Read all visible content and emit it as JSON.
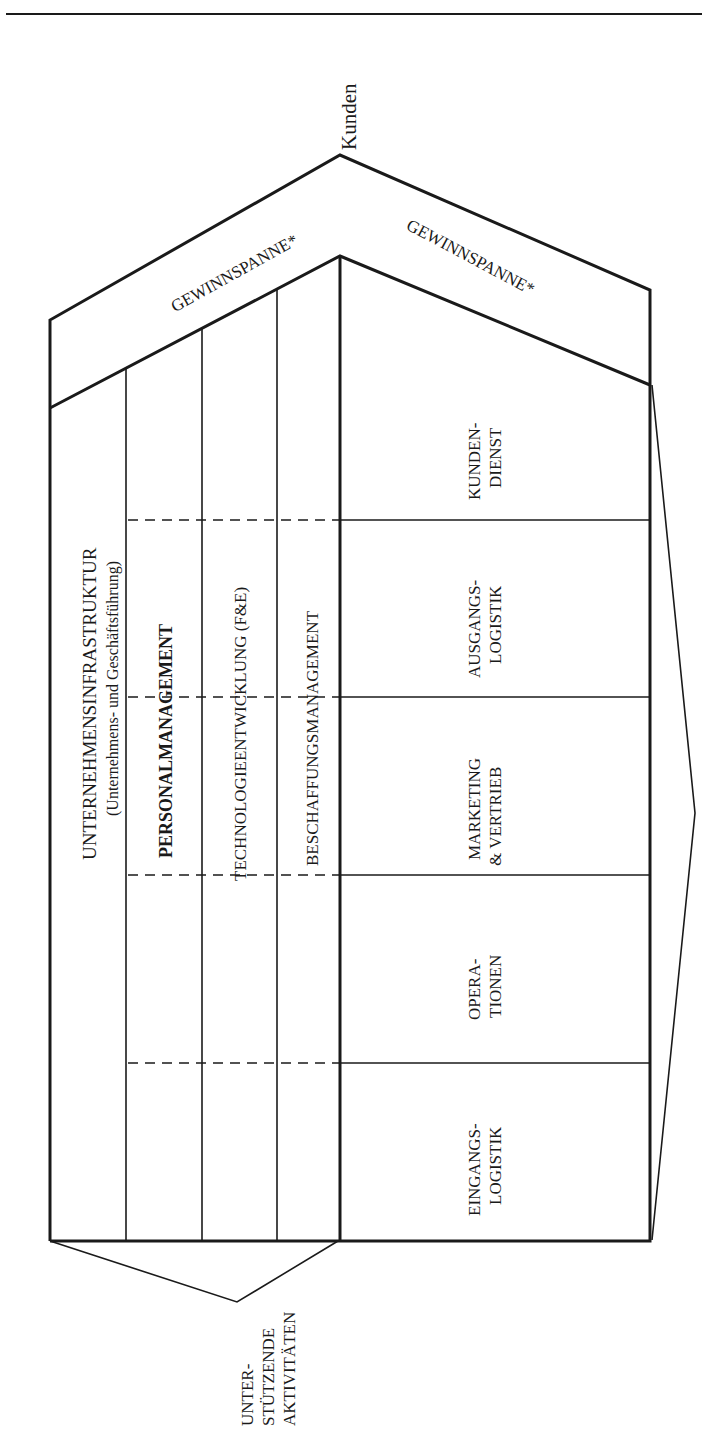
{
  "diagram": {
    "customers_label": "Kunden",
    "margin_left": "GEWINNSPANNE*",
    "margin_right": "GEWINNSPANNE*",
    "support_activities": [
      {
        "label": "UNTERNEHMENSINFRASTRUKTUR",
        "sublabel": "(Unternehmens- und Geschäftsführung)"
      },
      {
        "label": "PERSONALMANAGEMENT"
      },
      {
        "label": "TECHNOLOGIEENTWICKLUNG (F&E)"
      },
      {
        "label": "BESCHAFFUNGSMANAGEMENT"
      }
    ],
    "primary_activities": [
      {
        "line1": "EINGANGS-",
        "line2": "LOGISTIK"
      },
      {
        "line1": "OPERA-",
        "line2": "TIONEN"
      },
      {
        "line1": "MARKETING",
        "line2": "& VERTRIEB"
      },
      {
        "line1": "AUSGANGS-",
        "line2": "LOGISTIK"
      },
      {
        "line1": "KUNDEN-",
        "line2": "DIENST"
      }
    ],
    "support_bracket_label": {
      "line1": "UNTER-",
      "line2": "STÜTZENDE",
      "line3": "AKTIVITÄTEN"
    },
    "colors": {
      "line": "#1a1a1a",
      "background": "#ffffff"
    }
  }
}
